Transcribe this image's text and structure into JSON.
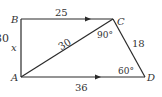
{
  "diagram": {
    "vertices": {
      "A": "A",
      "B": "B",
      "C": "C",
      "D": "D"
    },
    "edges": {
      "BC": "25",
      "AD": "36",
      "AC": "30",
      "CD": "18",
      "AB": "x"
    },
    "angles": {
      "C": "90°",
      "D": "60°"
    },
    "side_fragment": "30",
    "colors": {
      "line": "#2a2a2a",
      "text": "#333333",
      "background": "#ffffff"
    }
  }
}
